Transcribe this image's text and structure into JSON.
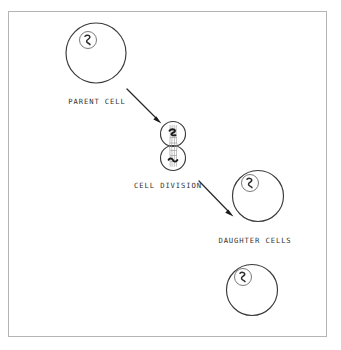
{
  "diagram": {
    "frame": {
      "border_color": "#b4b4b4",
      "x": 8,
      "y": 11,
      "width": 319,
      "height": 326
    },
    "ink_color": "#3a3a3a",
    "background_color": "#ffffff",
    "labels": [
      {
        "id": "parent-cell",
        "text": "PARENT CELL",
        "x": 97,
        "y": 104
      },
      {
        "id": "cell-division",
        "text": "CELL DIVISION",
        "x": 168,
        "y": 188
      },
      {
        "id": "daughter-cells",
        "text": "DAUGHTER CELLS",
        "x": 255,
        "y": 243
      }
    ],
    "cells": [
      {
        "id": "parent-cell",
        "role": "parent",
        "cx": 96,
        "cy": 53,
        "r": 30,
        "nucleus": {
          "cx": 88,
          "cy": 40,
          "r": 8.5
        }
      },
      {
        "id": "dividing-cell-upper",
        "role": "dividing",
        "cx": 173,
        "cy": 134,
        "r": 12.5,
        "nucleus": null
      },
      {
        "id": "dividing-cell-lower",
        "role": "dividing",
        "cx": 173,
        "cy": 158,
        "r": 12.5,
        "nucleus": null
      },
      {
        "id": "daughter-cell-1",
        "role": "daughter",
        "cx": 258,
        "cy": 196,
        "r": 25.5,
        "nucleus": {
          "cx": 250,
          "cy": 183,
          "r": 8.5
        }
      },
      {
        "id": "daughter-cell-2",
        "role": "daughter",
        "cx": 252,
        "cy": 290,
        "r": 25.5,
        "nucleus": {
          "cx": 243,
          "cy": 277,
          "r": 8.5
        }
      }
    ],
    "arrows": [
      {
        "id": "arrow-parent-to-division",
        "from": {
          "x": 127,
          "y": 89
        },
        "to": {
          "x": 161,
          "y": 123
        }
      },
      {
        "id": "arrow-division-to-daughter",
        "from": {
          "x": 199,
          "y": 181
        },
        "to": {
          "x": 233,
          "y": 216
        }
      }
    ],
    "spindle": {
      "id": "spindle-fibers",
      "description": "stippled spindle fibers between dividing cells",
      "cx": 173,
      "top_y": 124,
      "bottom_y": 168
    }
  }
}
